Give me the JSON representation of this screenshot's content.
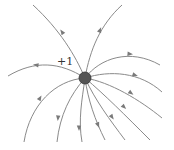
{
  "diagram": {
    "charge": {
      "label": "+1",
      "x": 85,
      "y": 78,
      "r": 6,
      "color": "#555555"
    },
    "line_color": "#8a8a8a",
    "field_lines": [
      {
        "id": "top-left",
        "d": "M85,78 C75,55 60,30 33,5",
        "arrow": {
          "x": 62,
          "y": 32,
          "angle": -125
        }
      },
      {
        "id": "top-right",
        "d": "M85,78 C90,50 100,25 122,5",
        "arrow": {
          "x": 100,
          "y": 30,
          "angle": -68
        }
      },
      {
        "id": "left",
        "d": "M85,78 C60,62 35,60 8,76",
        "arrow": {
          "x": 36,
          "y": 65,
          "angle": 188
        }
      },
      {
        "id": "right-upper",
        "d": "M85,78 C100,58 130,48 160,65",
        "arrow": {
          "x": 130,
          "y": 54,
          "angle": 5
        }
      },
      {
        "id": "right-middle",
        "d": "M85,78 C110,70 140,72 162,92",
        "arrow": {
          "x": 135,
          "y": 75,
          "angle": 18
        }
      },
      {
        "id": "right-lower-1",
        "d": "M85,78 C110,82 140,100 162,118",
        "arrow": {
          "x": 131,
          "y": 93,
          "angle": 35
        }
      },
      {
        "id": "right-lower-2",
        "d": "M85,78 C105,95 125,115 150,140",
        "arrow": {
          "x": 124,
          "y": 107,
          "angle": 45
        }
      },
      {
        "id": "down-right-1",
        "d": "M85,78 C95,100 110,120 125,140",
        "arrow": {
          "x": 112,
          "y": 117,
          "angle": 55
        }
      },
      {
        "id": "down-right-2",
        "d": "M85,78 C88,100 95,120 105,140",
        "arrow": {
          "x": 98,
          "y": 125,
          "angle": 68
        }
      },
      {
        "id": "down",
        "d": "M85,78 C82,100 78,120 82,142",
        "arrow": {
          "x": 79,
          "y": 128,
          "angle": 90
        }
      },
      {
        "id": "down-left",
        "d": "M85,78 C70,95 60,115 57,142",
        "arrow": {
          "x": 58,
          "y": 118,
          "angle": 95
        }
      },
      {
        "id": "lower-left",
        "d": "M85,78 C55,80 30,105 24,142",
        "arrow": {
          "x": 40,
          "y": 98,
          "angle": -60
        }
      }
    ]
  }
}
